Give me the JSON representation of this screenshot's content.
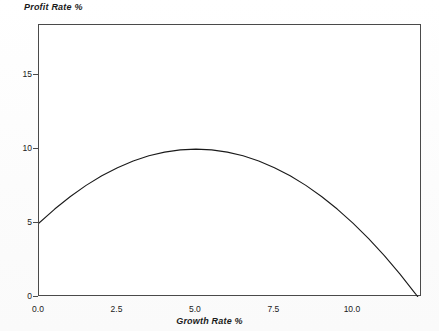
{
  "chart_data": {
    "type": "line",
    "title": "",
    "xlabel": "Growth Rate %",
    "ylabel": "Profit Rate %",
    "xlim": [
      0,
      12.2
    ],
    "ylim": [
      0,
      18.4
    ],
    "grid": false,
    "legend": null,
    "xticks": [
      "0.0",
      "2.5",
      "5.0",
      "7.5",
      "10.0"
    ],
    "xtick_values": [
      0,
      2.5,
      5,
      7.5,
      10
    ],
    "yticks": [
      "0",
      "5",
      "10",
      "15"
    ],
    "ytick_values": [
      0,
      5,
      10,
      15
    ],
    "equation": "y = 5 + 2x - 0.2x^2",
    "series": [
      {
        "name": "Profit rate curve",
        "x": [
          0,
          0.5,
          1,
          1.5,
          2,
          2.5,
          3,
          3.5,
          4,
          4.5,
          5,
          5.5,
          6,
          6.5,
          7,
          7.5,
          8,
          8.5,
          9,
          9.5,
          10,
          10.5,
          11,
          11.5,
          12,
          12.07
        ],
        "values": [
          5,
          5.95,
          6.8,
          7.55,
          8.2,
          8.75,
          9.2,
          9.55,
          9.8,
          9.95,
          10,
          9.95,
          9.8,
          9.55,
          9.2,
          8.75,
          8.2,
          7.55,
          6.8,
          5.95,
          5,
          3.95,
          2.8,
          1.55,
          0.2,
          0
        ]
      }
    ],
    "annotations": {
      "start_point": {
        "x": 0,
        "y": 5
      },
      "peak_point": {
        "x": 5,
        "y": 10
      },
      "end_point": {
        "x": 12.07,
        "y": 0
      }
    },
    "colors": {
      "curve": "#1a1a1a",
      "frame": "#4a4a4a",
      "background": "#ffffff",
      "text": "#1a1a1a"
    }
  }
}
